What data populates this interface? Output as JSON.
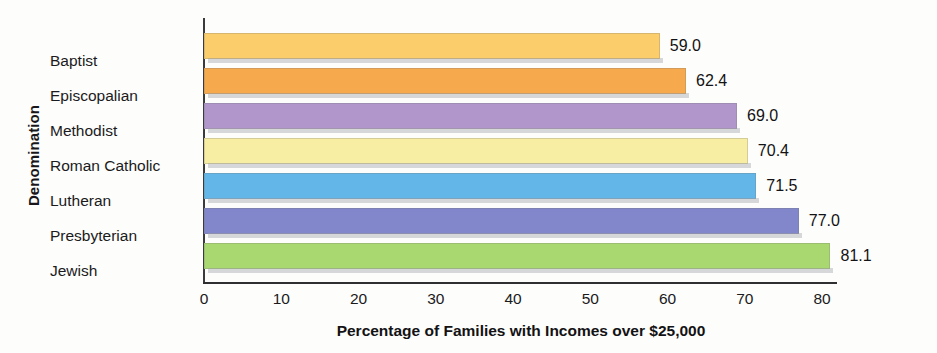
{
  "chart_data": {
    "type": "bar",
    "orientation": "horizontal",
    "title": "",
    "xlabel": "Percentage of Families with Incomes over $25,000",
    "ylabel": "Denomination",
    "categories": [
      "Baptist",
      "Episcopalian",
      "Methodist",
      "Roman Catholic",
      "Lutheran",
      "Presbyterian",
      "Jewish"
    ],
    "values": [
      59.0,
      62.4,
      69.0,
      70.4,
      71.5,
      77.0,
      81.1
    ],
    "value_labels": [
      "59.0",
      "62.4",
      "69.0",
      "70.4",
      "71.5",
      "77.0",
      "81.1"
    ],
    "colors": [
      "#fbce6b",
      "#f7a94e",
      "#b196cb",
      "#f8eea3",
      "#63b6e8",
      "#8287cb",
      "#a9d870"
    ],
    "xlim": [
      0,
      80
    ],
    "x_ticks": [
      0,
      10,
      20,
      30,
      40,
      50,
      60,
      70,
      80
    ],
    "x_tick_labels": [
      "0",
      "10",
      "20",
      "30",
      "40",
      "50",
      "60",
      "70",
      "80"
    ],
    "grid": false,
    "legend": false
  }
}
